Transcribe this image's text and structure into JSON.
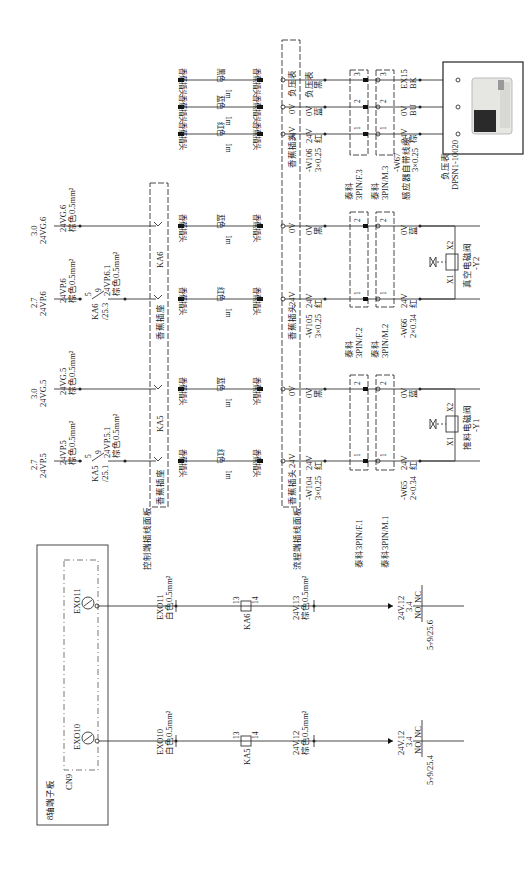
{
  "diagram": {
    "title": "8轴端子板",
    "connector": "CN9",
    "outputs": [
      {
        "id": "EXO10",
        "wire_label": "EXO10",
        "wire_spec": "白色0.5mm²",
        "relay": "KA5",
        "relay_pins": [
          "13",
          "14"
        ],
        "out_label": "24V.12",
        "out_spec": "棕色0.5mm²",
        "ref_top": "24V.12",
        "ref_mid": "3.4",
        "no": "NO",
        "nc": "NC",
        "contact_ref": "5-⁄9/25.4"
      },
      {
        "id": "EXO11",
        "wire_label": "EXO11",
        "wire_spec": "白色0.5mm²",
        "relay": "KA6",
        "relay_pins": [
          "13",
          "14"
        ],
        "out_label": "24V.13",
        "out_spec": "棕色0.5mm²",
        "ref_top": "24V.12",
        "ref_mid": "3.4",
        "no": "NO",
        "nc": "NC",
        "contact_ref": "5-⁄9/25.6"
      }
    ],
    "panels": {
      "control_panel_label": "控制端插线面板",
      "flow_panel_label": "流程端插线面板",
      "banana_socket": "香蕉插座",
      "banana_plug": "香蕉插头"
    },
    "supplies": [
      {
        "ref": "2.7",
        "net": "24VP.5",
        "wire": "24VP.5",
        "spec": "棕色0.5mm²",
        "contact": "KA5",
        "contact_ref": "/25.1",
        "pin_a": "5",
        "pin_b": "9",
        "out_wire": "24VP.5.1",
        "out_spec": "棕色0.5mm²"
      },
      {
        "ref": "3.0",
        "net": "24VG.5",
        "wire": "24VG.5",
        "spec": "棕色0.5mm²"
      },
      {
        "ref": "2.7",
        "net": "24VP.6",
        "wire": "24VP.6",
        "spec": "棕色0.5mm²",
        "contact": "KA6",
        "contact_ref": "/25.3",
        "pin_a": "5",
        "pin_b": "9",
        "out_wire": "24VP.6.1",
        "out_spec": "棕色0.5mm²"
      },
      {
        "ref": "3.0",
        "net": "24VG.6",
        "wire": "24VG.6",
        "spec": "棕色0.5mm²"
      }
    ],
    "group_labels": {
      "ka5": "KA5",
      "ka6": "KA6"
    },
    "jumpers": [
      {
        "left": "香蕉插头",
        "color": "红色",
        "right": "香蕉插头",
        "length": "1m"
      },
      {
        "left": "香蕉插头",
        "color": "蓝色",
        "right": "香蕉插头",
        "length": "1m"
      },
      {
        "left": "香蕉插头",
        "color": "红色",
        "right": "香蕉插头",
        "length": "1m"
      },
      {
        "left": "香蕉插头",
        "color": "蓝色",
        "right": "香蕉插头",
        "length": "1m"
      },
      {
        "left": "香蕉插头",
        "color": "红色",
        "right": "香蕉插头",
        "length": "1m"
      },
      {
        "left": "香蕉插头",
        "color": "蓝色",
        "right": "香蕉插头",
        "length": "1m"
      },
      {
        "left": "香蕉插头",
        "color": "黑色",
        "right": "香蕉插头",
        "length": "1m"
      }
    ],
    "cables": [
      {
        "id": "-W104",
        "spec": "3×0.25",
        "conductors": [
          {
            "v": "24V",
            "c": "红"
          },
          {
            "v": "0V",
            "c": "黑"
          }
        ],
        "plug_f": "泰科3PIN/F.1",
        "plug_m": "泰科3PIN/M.1",
        "sensor_cable": "-W65",
        "sensor_spec": "2×0.34",
        "sensor_conductors": [
          {
            "v": "24V",
            "c": "红"
          },
          {
            "v": "0V",
            "c": "蓝"
          }
        ],
        "valve": "推料电磁阀",
        "valve_tag": "-Y1",
        "coil_pins": [
          "X1",
          "X2"
        ]
      },
      {
        "id": "-W105",
        "spec": "3×0.25",
        "conductors": [
          {
            "v": "24V",
            "c": "红"
          },
          {
            "v": "0V",
            "c": "黑"
          }
        ],
        "plug_f_brand": "泰科",
        "plug_f": "3PIN/F.2",
        "plug_m_brand": "泰科",
        "plug_m": "3PIN/M.2",
        "sensor_cable": "-W66",
        "sensor_spec": "2×0.34",
        "sensor_conductors": [
          {
            "v": "24V",
            "c": "红"
          },
          {
            "v": "0V",
            "c": "蓝"
          }
        ],
        "valve": "真空电磁阀",
        "valve_tag": "-Y2",
        "coil_pins": [
          "X1",
          "X2"
        ]
      },
      {
        "id": "-W106",
        "spec": "3×0.25",
        "conductors": [
          {
            "v": "24V",
            "c": "红"
          },
          {
            "v": "0V",
            "c": "蓝"
          },
          {
            "v": "负压表",
            "c": "黑"
          }
        ],
        "plug_f_brand": "泰科",
        "plug_f": "3PIN/F.3",
        "plug_m_brand": "泰科",
        "plug_m": "3PIN/M.3",
        "sensor_cable": "-W67",
        "sensor_cable_desc": "感应器自带线缆",
        "sensor_spec": "3×0.25",
        "sensor_conductors": [
          {
            "v": "24V",
            "c": "棕"
          },
          {
            "v": "0V",
            "c": "BU"
          },
          {
            "v": "EX15",
            "c": "BK"
          }
        ]
      }
    ],
    "pin_numbers": [
      "1",
      "2",
      "3"
    ],
    "panel_socket_labels": {
      "v24": "24V",
      "v0": "0V",
      "gauge": "负压表"
    },
    "sensor": {
      "name": "负压表",
      "model": "DPSN1-10020"
    }
  }
}
